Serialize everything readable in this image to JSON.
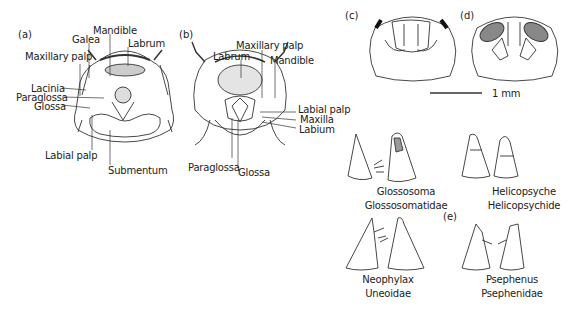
{
  "figure": {
    "panels": {
      "a": {
        "tag": "(a)",
        "labels": {
          "mandible": "Mandible",
          "galea": "Galea",
          "labrum": "Labrum",
          "maxillary_palp": "Maxillary palp",
          "lacinia": "Lacinia",
          "paraglossa": "Paraglossa",
          "glossa": "Glossa",
          "labial_palp": "Labial palp",
          "submentum": "Submentum"
        }
      },
      "b": {
        "tag": "(b)",
        "labels": {
          "maxillary_palp": "Maxillary palp",
          "labrum": "Labrum",
          "mandible": "Mandible",
          "labial_palp": "Labial palp",
          "maxilla": "Maxilla",
          "labium": "Labium",
          "paraglossa": "Paraglossa",
          "glossa": "Glossa"
        }
      },
      "c": {
        "tag": "(c)"
      },
      "d": {
        "tag": "(d)"
      },
      "scale_bar": {
        "label": "1 mm"
      },
      "e": {
        "tag": "(e)",
        "taxa": [
          {
            "genus": "Glossosoma",
            "family": "Glossosomatidae"
          },
          {
            "genus": "Helicopsyche",
            "family": "Helicopsychide"
          },
          {
            "genus": "Neophylax",
            "family": "Uneoidae"
          },
          {
            "genus": "Psephenus",
            "family": "Psephenidae"
          }
        ]
      }
    }
  }
}
